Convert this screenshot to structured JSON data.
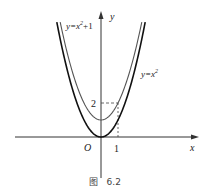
{
  "figure": {
    "caption": "图   6.2",
    "axes": {
      "x_label": "x",
      "y_label": "y",
      "origin_label": "O",
      "x_tick_label": "1",
      "y_tick_label": "2"
    },
    "curves": [
      {
        "name": "y=x²+1",
        "label": "y=x²+1",
        "label_main": "y=x",
        "label_sup": "2",
        "label_tail": "+1",
        "stroke": "#555555",
        "equation": "x^2+1"
      },
      {
        "name": "y=x²",
        "label": "y=x²",
        "label_main": "y=x",
        "label_sup": "2",
        "label_tail": "",
        "stroke": "#111111",
        "equation": "x^2"
      }
    ],
    "guides": {
      "x": 1,
      "y": 2,
      "style": "dashed"
    }
  },
  "chart_data": {
    "type": "line",
    "title": "图 6.2",
    "xlabel": "x",
    "ylabel": "y",
    "series": [
      {
        "name": "y=x²+1",
        "x": [
          -2.3,
          -2,
          -1.5,
          -1,
          -0.5,
          0,
          0.5,
          1,
          1.5,
          2,
          2.3
        ],
        "values": [
          6.29,
          5,
          3.25,
          2,
          1.25,
          1,
          1.25,
          2,
          3.25,
          5,
          6.29
        ]
      },
      {
        "name": "y=x²",
        "x": [
          -2.6,
          -2,
          -1.5,
          -1,
          -0.5,
          0,
          0.5,
          1,
          1.5,
          2,
          2.6
        ],
        "values": [
          6.76,
          4,
          2.25,
          1,
          0.25,
          0,
          0.25,
          1,
          2.25,
          4,
          6.76
        ]
      }
    ],
    "annotations": [
      "O",
      "1",
      "2",
      "dashed guide from (1,0) to (1,2) to (0,2)"
    ],
    "grid": false,
    "legend": "inline labels"
  }
}
